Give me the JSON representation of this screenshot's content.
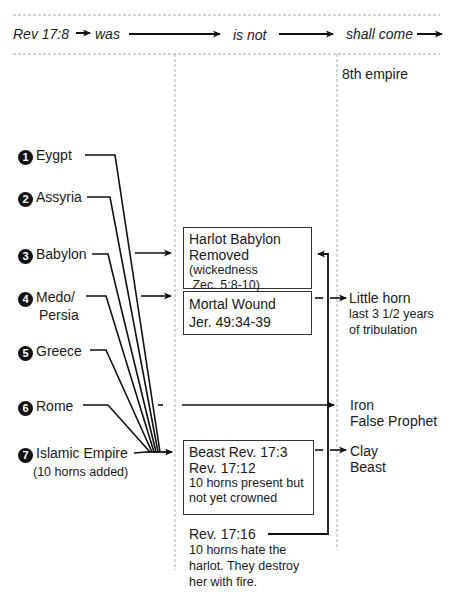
{
  "header": {
    "ref": "Rev 17:8",
    "was": "was",
    "is_not": "is not",
    "shall_come": "shall come"
  },
  "eighth_empire": "8th empire",
  "empires": [
    {
      "num": "1",
      "name": "Eygpt"
    },
    {
      "num": "2",
      "name": "Assyria"
    },
    {
      "num": "3",
      "name": "Babylon"
    },
    {
      "num": "4",
      "name": "Medo/",
      "name2": "Persia"
    },
    {
      "num": "5",
      "name": "Greece"
    },
    {
      "num": "6",
      "name": "Rome"
    },
    {
      "num": "7",
      "name": "Islamic Empire",
      "note": "(10 horns added)"
    }
  ],
  "boxes": {
    "harlot": {
      "line1": "Harlot Babylon",
      "line2": "Removed",
      "line3": "(wickedness",
      "line4": " Zec. 5:8-10)"
    },
    "wound": {
      "line1": "Mortal Wound",
      "line2": "Jer. 49:34-39"
    },
    "beast": {
      "line1": "Beast Rev. 17:3",
      "line2": "Rev. 17:12",
      "line3": "10 horns present but",
      "line4": "not yet crowned"
    }
  },
  "rev1716": {
    "line1": "Rev. 17:16",
    "line2": "10 horns hate the",
    "line3": "harlot. They destroy",
    "line4": "her with fire."
  },
  "outcomes": {
    "little_horn": {
      "line1": "Little horn",
      "line2": "last 3 1/2 years",
      "line3": "of tribulation"
    },
    "iron": {
      "line1": "Iron",
      "line2": "False Prophet"
    },
    "clay": {
      "line1": "Clay",
      "line2": "Beast"
    }
  }
}
